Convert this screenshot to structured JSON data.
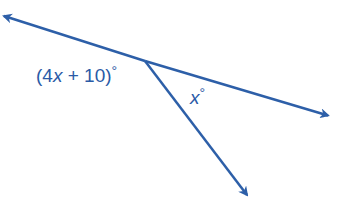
{
  "diagram": {
    "type": "angle-diagram",
    "line_color": "#2d5fa8",
    "label_color": "#2a5aa6",
    "vertex": {
      "x": 145,
      "y": 61
    },
    "rays": [
      {
        "name": "left-ray",
        "from": {
          "x": 145,
          "y": 61
        },
        "to": {
          "x": 2,
          "y": 15
        }
      },
      {
        "name": "right-ray",
        "from": {
          "x": 145,
          "y": 61
        },
        "to": {
          "x": 330,
          "y": 116
        }
      },
      {
        "name": "down-ray",
        "from": {
          "x": 145,
          "y": 61
        },
        "to": {
          "x": 248,
          "y": 196
        }
      }
    ],
    "labels": {
      "angle_left": {
        "open": "(4",
        "var": "x",
        "rest": " + 10)",
        "degree": "°"
      },
      "angle_right": {
        "var": "x",
        "degree": "°"
      }
    }
  }
}
